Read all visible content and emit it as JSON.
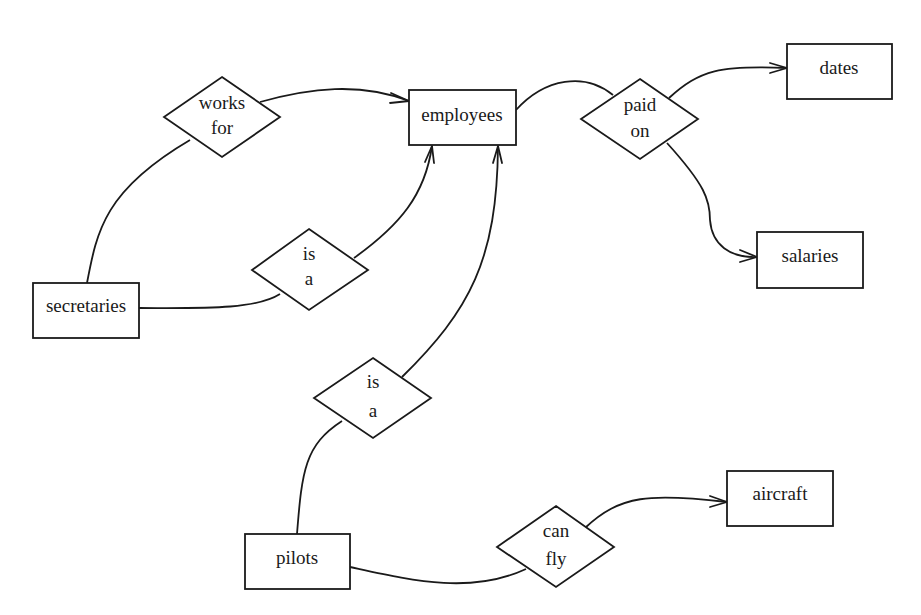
{
  "diagram": {
    "type": "entity-relationship",
    "colors": {
      "stroke": "#1a1a1a",
      "fill": "#ffffff",
      "text": "#1a1a1a"
    },
    "entities": [
      {
        "id": "employees",
        "label": "employees"
      },
      {
        "id": "dates",
        "label": "dates"
      },
      {
        "id": "salaries",
        "label": "salaries"
      },
      {
        "id": "secretaries",
        "label": "secretaries"
      },
      {
        "id": "pilots",
        "label": "pilots"
      },
      {
        "id": "aircraft",
        "label": "aircraft"
      }
    ],
    "relationships": [
      {
        "id": "works-for",
        "lines": [
          "works",
          "for"
        ]
      },
      {
        "id": "paid-on",
        "lines": [
          "paid",
          "on"
        ]
      },
      {
        "id": "is-a-secretaries",
        "lines": [
          "is",
          "a"
        ]
      },
      {
        "id": "is-a-pilots",
        "lines": [
          "is",
          "a"
        ]
      },
      {
        "id": "can-fly",
        "lines": [
          "can",
          "fly"
        ]
      }
    ],
    "edges": [
      {
        "from": "secretaries",
        "to": "works-for",
        "arrow": false
      },
      {
        "from": "works-for",
        "to": "employees",
        "arrow": true
      },
      {
        "from": "secretaries",
        "to": "is-a-secretaries",
        "arrow": false
      },
      {
        "from": "is-a-secretaries",
        "to": "employees",
        "arrow": true
      },
      {
        "from": "pilots",
        "to": "is-a-pilots",
        "arrow": false
      },
      {
        "from": "is-a-pilots",
        "to": "employees",
        "arrow": true
      },
      {
        "from": "employees",
        "to": "paid-on",
        "arrow": false
      },
      {
        "from": "paid-on",
        "to": "dates",
        "arrow": true
      },
      {
        "from": "paid-on",
        "to": "salaries",
        "arrow": true
      },
      {
        "from": "pilots",
        "to": "can-fly",
        "arrow": false
      },
      {
        "from": "can-fly",
        "to": "aircraft",
        "arrow": true
      }
    ]
  }
}
